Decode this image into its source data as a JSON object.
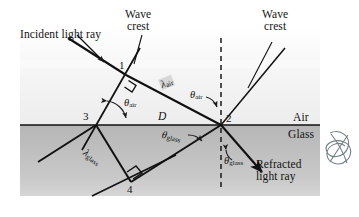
{
  "figure": {
    "media": {
      "upper_label": "Air",
      "lower_label": "Glass",
      "air_color": "#f7f7f7",
      "glass_color": "#bcbcbc",
      "interface_color": "#111111"
    },
    "annotations": {
      "incident_ray": "Incident light ray",
      "refracted_ray_line1": "Refracted",
      "refracted_ray_line2": "light ray",
      "wave_crest_left_line1": "Wave",
      "wave_crest_left_line2": "crest",
      "wave_crest_right_line1": "Wave",
      "wave_crest_right_line2": "crest",
      "distance_label": "D"
    },
    "points": [
      {
        "id": "1",
        "label": "1",
        "x": 125,
        "y": 74
      },
      {
        "id": "2",
        "label": "2",
        "x": 221,
        "y": 125
      },
      {
        "id": "3",
        "label": "3",
        "x": 96,
        "y": 125
      },
      {
        "id": "4",
        "label": "4",
        "x": 130,
        "y": 182
      }
    ],
    "angles": [
      {
        "name": "theta-air-at-point-3",
        "symbol": "θ",
        "subscript": "air"
      },
      {
        "name": "theta-air-at-normal",
        "symbol": "θ",
        "subscript": "air"
      },
      {
        "name": "theta-glass-at-point-2",
        "symbol": "θ",
        "subscript": "glass"
      },
      {
        "name": "theta-glass-at-normal",
        "symbol": "θ",
        "subscript": "glass"
      }
    ],
    "wavelengths": [
      {
        "name": "lambda-air",
        "symbol": "λ",
        "subscript": "air"
      },
      {
        "name": "lambda-glass",
        "symbol": "λ",
        "subscript": "glass"
      }
    ],
    "symbols": {
      "theta": "θ",
      "lambda": "λ",
      "sub_air": "air",
      "sub_glass": "glass"
    }
  }
}
